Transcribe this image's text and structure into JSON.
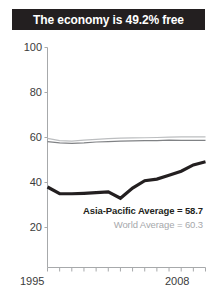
{
  "header": {
    "title": "The economy is 49.2% free"
  },
  "chart_data": {
    "type": "line",
    "title": "The economy is 49.2% free",
    "xlabel": "",
    "ylabel": "",
    "xlim": [
      1995,
      2008
    ],
    "ylim": [
      0,
      100
    ],
    "yticks": [
      100,
      80,
      60,
      40,
      20
    ],
    "xticks": [
      1995,
      1996,
      1997,
      1998,
      1999,
      2000,
      2001,
      2002,
      2003,
      2004,
      2005,
      2006,
      2007,
      2008
    ],
    "xtick_labels_shown": [
      "1995",
      "2008"
    ],
    "grid": false,
    "legend": "none",
    "x": [
      1995,
      1996,
      1997,
      1998,
      1999,
      2000,
      2001,
      2002,
      2003,
      2004,
      2005,
      2006,
      2007,
      2008
    ],
    "series": [
      {
        "name": "Country score",
        "color": "#231f20",
        "width": 3.2,
        "values": [
          38.0,
          35.0,
          35.0,
          35.2,
          35.5,
          35.8,
          33.0,
          37.5,
          40.8,
          41.5,
          43.2,
          45.0,
          47.8,
          49.2
        ]
      },
      {
        "name": "Asia-Pacific Average",
        "color": "#808285",
        "width": 1.2,
        "values": [
          58.2,
          57.6,
          57.4,
          57.6,
          58.0,
          58.2,
          58.4,
          58.5,
          58.6,
          58.6,
          58.8,
          58.7,
          58.7,
          58.7
        ]
      },
      {
        "name": "World Average",
        "color": "#bcbec0",
        "width": 1.2,
        "values": [
          59.6,
          58.6,
          58.4,
          58.8,
          59.2,
          59.5,
          59.7,
          59.8,
          59.9,
          60.0,
          60.2,
          60.3,
          60.3,
          60.3
        ]
      }
    ],
    "annotations": [
      {
        "label": "Asia-Pacific Average = 58.7",
        "value": 58.7,
        "color": "#231f20"
      },
      {
        "label": "World Average = 60.3",
        "value": 60.3,
        "color": "#a6a8ab"
      }
    ]
  },
  "axis": {
    "y_labels": [
      "100",
      "80",
      "60",
      "40",
      "20"
    ],
    "x_label_start": "1995",
    "x_label_end": "2008"
  },
  "annotations": {
    "asia_pacific": "Asia-Pacific Average = 58.7",
    "world": "World Average = 60.3"
  },
  "colors": {
    "banner_bg": "#231f20",
    "banner_text": "#ffffff",
    "country_line": "#231f20",
    "asia_line": "#808285",
    "world_line": "#bcbec0",
    "axis": "#a7a9ac",
    "tick_text": "#3b3b3b"
  }
}
